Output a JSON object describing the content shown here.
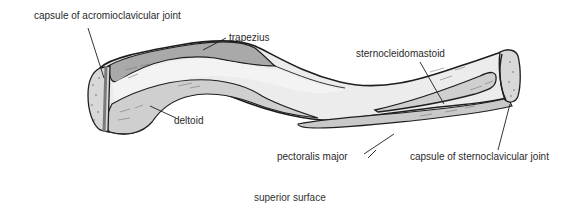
{
  "figure": {
    "caption": "superior surface",
    "labels": {
      "acromioclavicular": "capsule of acromioclavicular joint",
      "trapezius": "trapezius",
      "deltoid": "deltoid",
      "sternocleidomastoid": "sternocleidomastoid",
      "pectoralis": "pectoralis major",
      "sternoclavicular": "capsule of sternoclavicular joint"
    },
    "colors": {
      "bone": "#e6e6e6",
      "bone_light": "#f3f3f3",
      "muscle_dark": "#a9a9a9",
      "muscle_mid": "#c9c9c9",
      "joint_surface": "#d8d8d8",
      "outline": "#1e1e1e"
    }
  }
}
